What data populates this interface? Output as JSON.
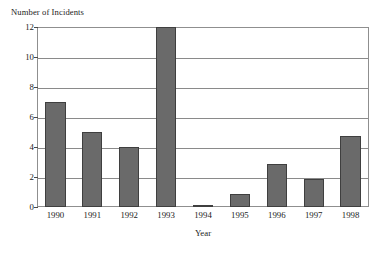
{
  "chart_data": {
    "type": "bar",
    "title": "",
    "ylabel": "Number of Incidents",
    "xlabel": "Year",
    "categories": [
      "1990",
      "1991",
      "1992",
      "1993",
      "1994",
      "1995",
      "1996",
      "1997",
      "1998"
    ],
    "values": [
      7,
      5,
      4,
      12,
      0.1,
      0.9,
      2.85,
      1.85,
      4.75
    ],
    "ylim": [
      0,
      12
    ],
    "yticks": [
      0,
      2,
      4,
      6,
      8,
      10,
      12
    ],
    "ytick_labels": [
      "0",
      "2",
      "4",
      "6",
      "8",
      "10",
      "12"
    ],
    "grid": "horizontal",
    "legend": "none",
    "bar_color": "#6a6a6a",
    "bar_edge_color": "#3f3f3f",
    "axis_color": "#8f8f8f",
    "background": "#ffffff"
  }
}
